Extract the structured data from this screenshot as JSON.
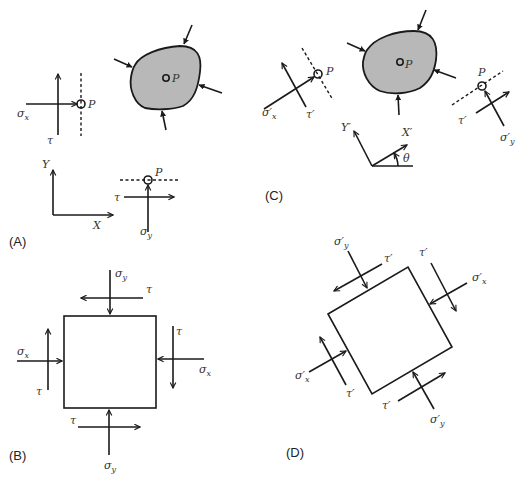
{
  "figure": {
    "colors": {
      "line": "#1a1a1a",
      "body_fill": "#b8b8b8",
      "text": "#333333",
      "background": "#ffffff"
    }
  },
  "panels": {
    "A": {
      "label": "(A)",
      "point_label": "P",
      "point_label_body": "P",
      "point_label_y": "P",
      "sigma_x": "σ",
      "sigma_x_sub": "x",
      "tau_x": "τ",
      "sigma_y": "σ",
      "sigma_y_sub": "y",
      "tau_y": "τ",
      "axis_x": "X",
      "axis_y": "Y"
    },
    "B": {
      "label": "(B)",
      "sigma_y_top": "σ",
      "sigma_y_top_sub": "y",
      "tau_top": "τ",
      "sigma_x_left": "σ",
      "sigma_x_left_sub": "x",
      "tau_left": "τ",
      "tau_right": "τ",
      "sigma_x_right": "σ",
      "sigma_x_right_sub": "x",
      "tau_bottom": "τ",
      "sigma_y_bottom": "σ",
      "sigma_y_bottom_sub": "y"
    },
    "C": {
      "label": "(C)",
      "point_label_x": "P",
      "point_label_body": "P",
      "point_label_y": "P",
      "sigma_x": "σ′",
      "sigma_x_sub": "x",
      "tau_x": "τ′",
      "tau_y": "τ′",
      "sigma_y": "σ′",
      "sigma_y_sub": "y",
      "axis_x": "X′",
      "axis_y": "Y′",
      "angle": "θ"
    },
    "D": {
      "label": "(D)",
      "sigma_y_top": "σ′",
      "sigma_y_top_sub": "y",
      "tau_top": "τ′",
      "tau_right": "τ′",
      "sigma_x_right": "σ′",
      "sigma_x_right_sub": "x",
      "sigma_x_left": "σ′",
      "sigma_x_left_sub": "x",
      "tau_left": "τ′",
      "tau_bottom": "τ′",
      "sigma_y_bottom": "σ′",
      "sigma_y_bottom_sub": "y"
    }
  }
}
